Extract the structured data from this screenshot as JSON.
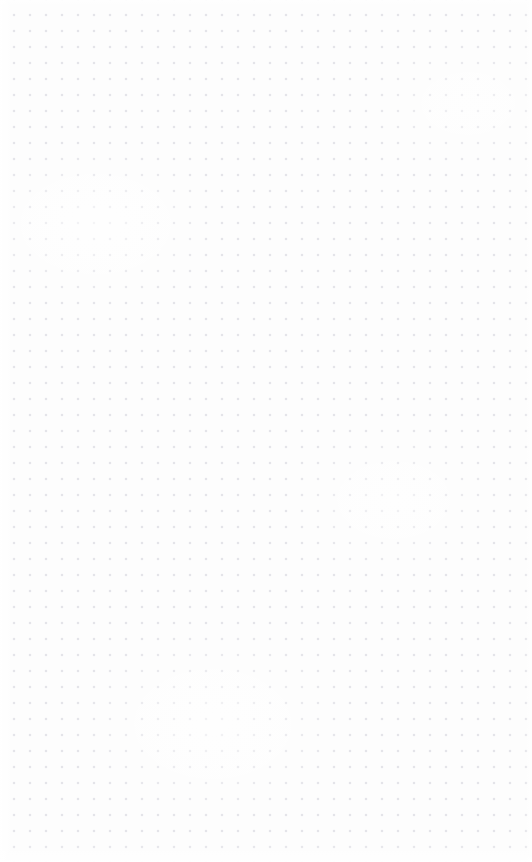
{
  "canvas": {
    "width": 532,
    "height": 862,
    "background_color": "#fdfdfd",
    "content_state": "empty",
    "empty_state_label": "",
    "grid": {
      "pattern": "dot-grid",
      "dot_color": "#e4e4e9",
      "dot_diameter_px": 1.5,
      "spacing_x_px": 16,
      "spacing_y_px": 16,
      "origin_offset_x_px": 6,
      "origin_offset_y_px": 7,
      "columns": 34,
      "rows": 54
    },
    "edge_vignette": {
      "color": "#ffffff",
      "left_px": 14,
      "bottom_px": 18,
      "right_px": 8,
      "top_px": 7
    }
  }
}
